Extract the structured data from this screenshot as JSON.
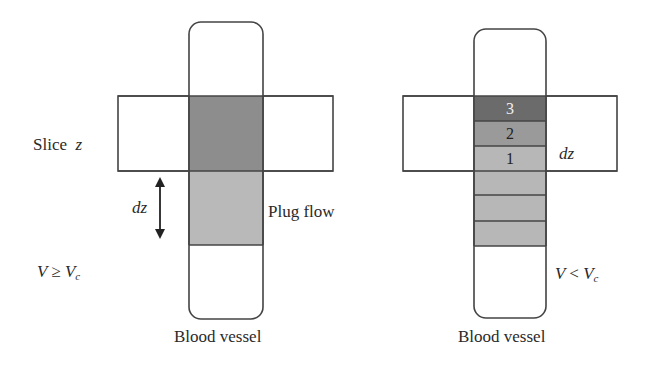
{
  "left_panel": {
    "slice_label": "Slice",
    "slice_var": "z",
    "dz_label": "dz",
    "flow_label": "Plug flow",
    "condition": {
      "v": "V",
      "op": "≥",
      "vc": "V",
      "sub": "c"
    },
    "vessel_label": "Blood vessel"
  },
  "right_panel": {
    "bands": [
      {
        "label": "3",
        "color": "#6b6b6b",
        "text_color": "#f0f0f0"
      },
      {
        "label": "2",
        "color": "#9a9a9a",
        "text_color": "#222222"
      },
      {
        "label": "1",
        "color": "#b7b7b7",
        "text_color": "#222222"
      }
    ],
    "dz_label": "dz",
    "condition": {
      "v": "V",
      "op": "<",
      "vc": "V",
      "sub": "c"
    },
    "vessel_label": "Blood vessel"
  },
  "colors": {
    "outline": "#444444",
    "slice_fill_dark": "#8d8d8d",
    "plug_fill_light": "#b9b9b9",
    "band_fill": "#b7b7b7"
  }
}
